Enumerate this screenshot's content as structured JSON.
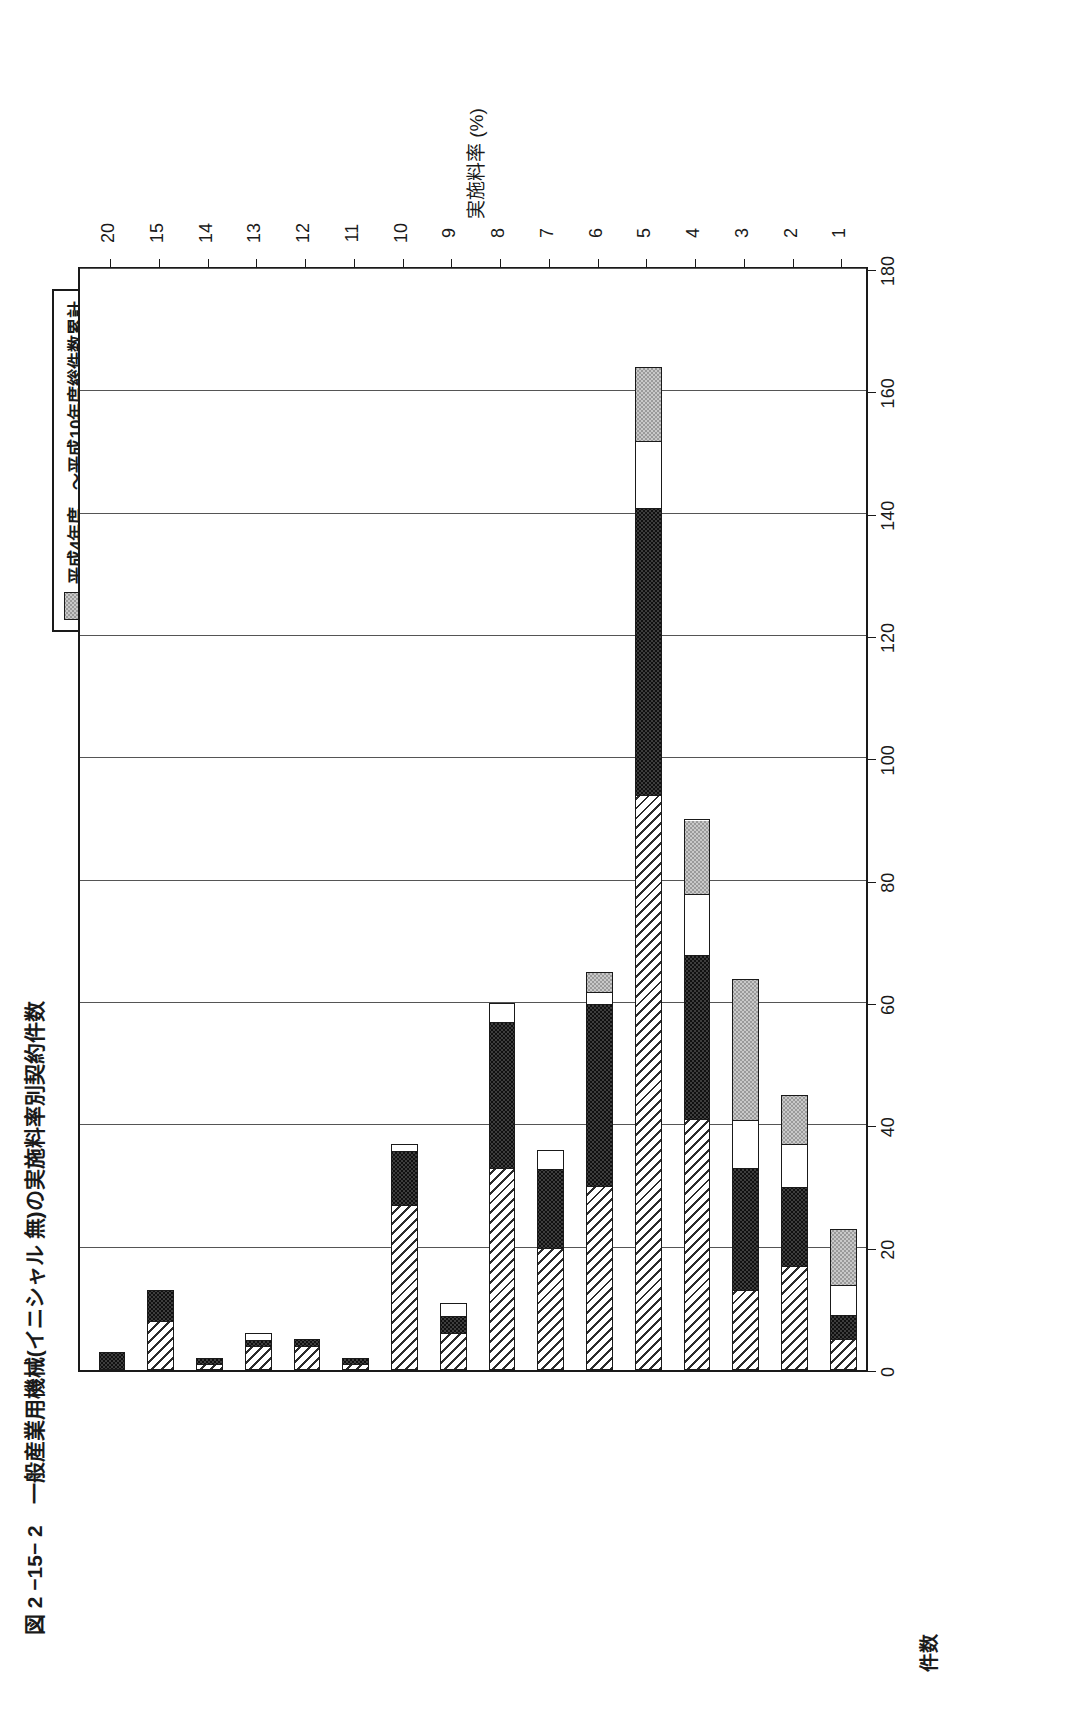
{
  "figure": {
    "number": "図 2 −15− 2",
    "title": "図 2 −15− 2　一般産業用機械(イニシャル 無)の実施料率別契約件数",
    "subject": "一般産業用機械(イニシャル 無)の実施料率別契約件数"
  },
  "legend": {
    "position": "top-left",
    "items": [
      {
        "label": "平成4年度　～平成10年度総件数累計",
        "pattern": "grey-dotted",
        "color": "#c9c9c9"
      },
      {
        "label": "昭和63年度　～平成3年度総件数累計",
        "pattern": "white",
        "color": "#ffffff"
      },
      {
        "label": "昭和49年　～昭和52年　総件数累計",
        "pattern": "dark-dotted",
        "color": "#3d3d3d"
      },
      {
        "label": "昭和43年　～昭和48年　総件数累計",
        "pattern": "diagonal-hatch",
        "color": "#ffffff"
      }
    ]
  },
  "axes": {
    "x_label": "実施料率 (%)",
    "y_label": "件数",
    "x_ticks": [
      "1",
      "2",
      "3",
      "4",
      "5",
      "6",
      "7",
      "8",
      "9",
      "10",
      "11",
      "12",
      "13",
      "14",
      "15",
      "20"
    ],
    "y_ticks": [
      "0",
      "20",
      "40",
      "60",
      "80",
      "100",
      "120",
      "140",
      "160",
      "180"
    ]
  },
  "chart_data": {
    "type": "bar",
    "orientation": "horizontal-stacked",
    "title": "一般産業用機械(イニシャル 無)の実施料率別契約件数",
    "xlabel": "実施料率 (%)",
    "ylabel": "件数",
    "ylim": [
      0,
      180
    ],
    "grid": true,
    "legend_position": "top-left",
    "categories": [
      "1",
      "2",
      "3",
      "4",
      "5",
      "6",
      "7",
      "8",
      "9",
      "10",
      "11",
      "12",
      "13",
      "14",
      "15",
      "20"
    ],
    "series": [
      {
        "name": "昭和43年　～昭和48年　総件数累計",
        "pattern": "diagonal-hatch",
        "values": [
          5,
          17,
          13,
          41,
          94,
          30,
          20,
          33,
          6,
          27,
          1,
          4,
          4,
          1,
          8,
          0
        ]
      },
      {
        "name": "昭和49年　～昭和52年　総件数累計",
        "pattern": "dark-dotted",
        "values": [
          4,
          13,
          20,
          27,
          47,
          30,
          13,
          24,
          3,
          9,
          1,
          1,
          1,
          1,
          5,
          3
        ]
      },
      {
        "name": "昭和63年度　～平成3年度総件数累計",
        "pattern": "white",
        "values": [
          5,
          7,
          8,
          10,
          11,
          2,
          3,
          3,
          2,
          1,
          0,
          0,
          1,
          0,
          0,
          0
        ]
      },
      {
        "name": "平成4年度　～平成10年度総件数累計",
        "pattern": "grey-dotted",
        "values": [
          9,
          8,
          23,
          12,
          12,
          3,
          0,
          0,
          0,
          0,
          0,
          0,
          0,
          0,
          0,
          0
        ]
      }
    ],
    "totals": [
      23,
      45,
      64,
      90,
      164,
      65,
      36,
      60,
      11,
      37,
      2,
      5,
      6,
      2,
      13,
      3
    ]
  }
}
